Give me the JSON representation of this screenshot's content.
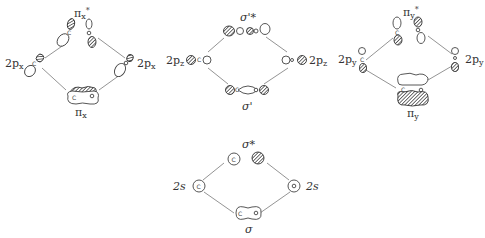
{
  "diagrams": [
    {
      "id": "pi-x",
      "left_label": "2p",
      "left_sub": "x",
      "right_label": "2p",
      "right_sub": "x",
      "top_label": "π",
      "top_sub": "x",
      "top_sup": "*",
      "bottom_label": "π",
      "bottom_sub": "x"
    },
    {
      "id": "sigma-prime",
      "left_label": "2p",
      "left_sub": "z",
      "right_label": "2p",
      "right_sub": "z",
      "top_label": "σ'*",
      "bottom_label": "σ'"
    },
    {
      "id": "pi-y",
      "left_label": "2p",
      "left_sub": "y",
      "right_label": "2p",
      "right_sub": "y",
      "top_label": "π",
      "top_sub": "y",
      "top_sup": "*",
      "bottom_label": "π",
      "bottom_sub": "y"
    },
    {
      "id": "sigma-2s",
      "left_label": "2s",
      "right_label": "2s",
      "top_label": "σ*",
      "bottom_label": "σ"
    }
  ],
  "atoms": {
    "left": "C",
    "right": "O"
  },
  "colors": {
    "line": "#888888",
    "outline": "#444444",
    "text": "#333333"
  }
}
